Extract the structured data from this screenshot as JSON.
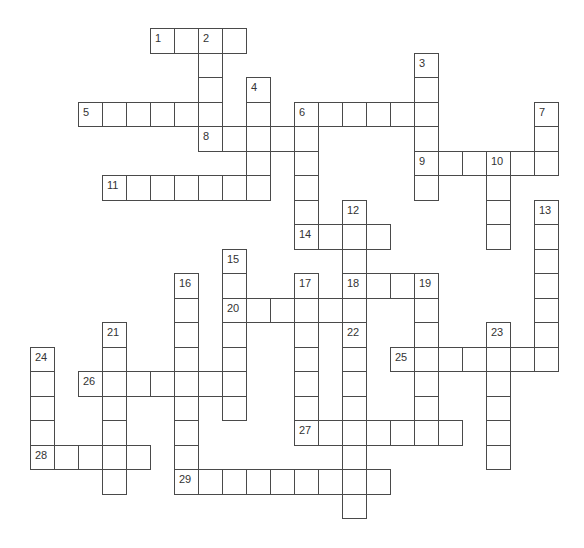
{
  "puzzle": {
    "type": "crossword",
    "grid_origin": {
      "x": 30,
      "y": 28
    },
    "cell_w": 24,
    "cell_h": 24.5,
    "line_color": "#4a4a4a",
    "entries": [
      {
        "number": "1",
        "direction": "across",
        "row": 0,
        "col": 5,
        "length": 4
      },
      {
        "number": "2",
        "direction": "down",
        "row": 0,
        "col": 7,
        "length": 5
      },
      {
        "number": "3",
        "direction": "down",
        "row": 1,
        "col": 16,
        "length": 6
      },
      {
        "number": "4",
        "direction": "down",
        "row": 2,
        "col": 9,
        "length": 5
      },
      {
        "number": "5",
        "direction": "across",
        "row": 3,
        "col": 2,
        "length": 6
      },
      {
        "number": "6",
        "direction": "across",
        "row": 3,
        "col": 11,
        "length": 6
      },
      {
        "number": "6",
        "direction": "down",
        "row": 3,
        "col": 11,
        "length": 6
      },
      {
        "number": "7",
        "direction": "down",
        "row": 3,
        "col": 21,
        "length": 3
      },
      {
        "number": "8",
        "direction": "across",
        "row": 4,
        "col": 7,
        "length": 5
      },
      {
        "number": "9",
        "direction": "across",
        "row": 5,
        "col": 16,
        "length": 6
      },
      {
        "number": "10",
        "direction": "down",
        "row": 5,
        "col": 19,
        "length": 4
      },
      {
        "number": "11",
        "direction": "across",
        "row": 6,
        "col": 3,
        "length": 7
      },
      {
        "number": "12",
        "direction": "down",
        "row": 7,
        "col": 13,
        "length": 5
      },
      {
        "number": "13",
        "direction": "down",
        "row": 7,
        "col": 21,
        "length": 7
      },
      {
        "number": "14",
        "direction": "across",
        "row": 8,
        "col": 11,
        "length": 4
      },
      {
        "number": "15",
        "direction": "down",
        "row": 9,
        "col": 8,
        "length": 7
      },
      {
        "number": "16",
        "direction": "down",
        "row": 10,
        "col": 6,
        "length": 9
      },
      {
        "number": "17",
        "direction": "down",
        "row": 10,
        "col": 11,
        "length": 7
      },
      {
        "number": "18",
        "direction": "across",
        "row": 10,
        "col": 13,
        "length": 4
      },
      {
        "number": "19",
        "direction": "down",
        "row": 10,
        "col": 16,
        "length": 7
      },
      {
        "number": "20",
        "direction": "across",
        "row": 11,
        "col": 8,
        "length": 5
      },
      {
        "number": "21",
        "direction": "down",
        "row": 12,
        "col": 3,
        "length": 7
      },
      {
        "number": "22",
        "direction": "down",
        "row": 12,
        "col": 13,
        "length": 8
      },
      {
        "number": "23",
        "direction": "down",
        "row": 12,
        "col": 19,
        "length": 6
      },
      {
        "number": "24",
        "direction": "down",
        "row": 13,
        "col": 0,
        "length": 5
      },
      {
        "number": "25",
        "direction": "across",
        "row": 13,
        "col": 15,
        "length": 7
      },
      {
        "number": "26",
        "direction": "across",
        "row": 14,
        "col": 2,
        "length": 7
      },
      {
        "number": "27",
        "direction": "across",
        "row": 16,
        "col": 11,
        "length": 7
      },
      {
        "number": "28",
        "direction": "across",
        "row": 17,
        "col": 0,
        "length": 5
      },
      {
        "number": "29",
        "direction": "across",
        "row": 18,
        "col": 6,
        "length": 9
      }
    ]
  }
}
